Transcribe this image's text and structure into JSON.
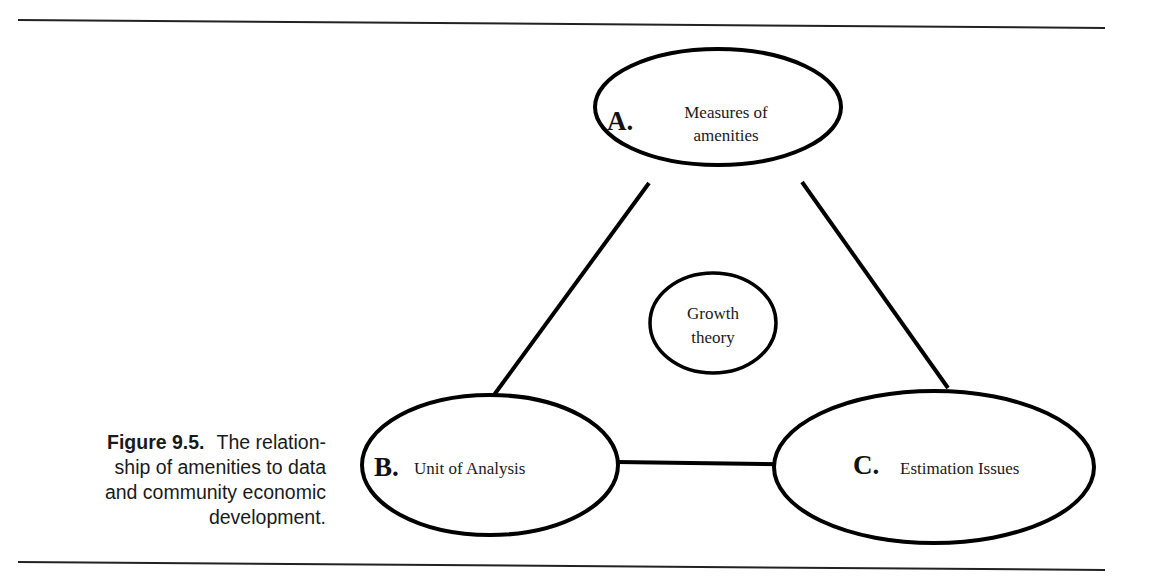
{
  "diagram": {
    "type": "relationship-triangle",
    "nodes": [
      {
        "id": "A",
        "letter": "A.",
        "lines": [
          "Measures of",
          "amenities"
        ]
      },
      {
        "id": "B",
        "letter": "B.",
        "lines": [
          "Unit of Analysis"
        ]
      },
      {
        "id": "C",
        "letter": "C.",
        "lines": [
          "Estimation Issues"
        ]
      },
      {
        "id": "G",
        "letter": "",
        "lines": [
          "Growth",
          "theory"
        ]
      }
    ],
    "edges": [
      {
        "from": "A",
        "to": "B"
      },
      {
        "from": "A",
        "to": "C"
      },
      {
        "from": "B",
        "to": "C"
      }
    ]
  },
  "nodes": {
    "a": {
      "letter": "A.",
      "line1": "Measures of",
      "line2": "amenities"
    },
    "b": {
      "letter": "B.",
      "line1": "Unit of Analysis"
    },
    "c": {
      "letter": "C.",
      "line1": "Estimation Issues"
    },
    "center": {
      "line1": "Growth",
      "line2": "theory"
    }
  },
  "caption": {
    "label": "Figure 9.5.",
    "text": "The relationship of amenities to data and community economic development.",
    "line1": "The relation-",
    "line2": "ship of amenities to data",
    "line3": "and community economic",
    "line4": "development."
  },
  "colors": {
    "stroke": "#000000",
    "background": "#ffffff",
    "text": "#1a1a1a"
  }
}
